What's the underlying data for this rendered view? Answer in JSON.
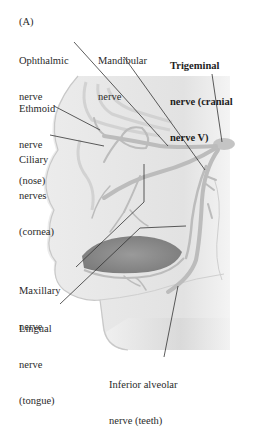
{
  "figure": {
    "panel_letter": "(A)",
    "subject": "trigeminal nerve",
    "colors": {
      "background": "#ffffff",
      "head_fill": "#e6e6e6",
      "nerve_fill": "#bdbdbd",
      "mouth_fill": "#8f8f8f",
      "leader_line": "#333333",
      "text": "#2a2a2a"
    }
  },
  "labels": {
    "ophthalmic": {
      "line1": "Ophthalmic",
      "line2": "nerve"
    },
    "mandibular": {
      "line1": "Mandibular",
      "line2": "nerve"
    },
    "trigeminal": {
      "line1": "Trigeminal",
      "line2": "nerve (cranial",
      "line3": "nerve V)"
    },
    "ethmoid": {
      "line1": "Ethmoid",
      "line2": "nerve",
      "line3": "(nose)"
    },
    "ciliary": {
      "line1": "Ciliary",
      "line2": "nerves",
      "line3": "(cornea)"
    },
    "maxillary": {
      "line1": "Maxillary",
      "line2": "nerve"
    },
    "lingual": {
      "line1": "Lingual",
      "line2": "nerve",
      "line3": "(tongue)"
    },
    "inferior_alveolar": {
      "line1": "Inferior alveolar",
      "line2": "nerve (teeth)"
    }
  }
}
